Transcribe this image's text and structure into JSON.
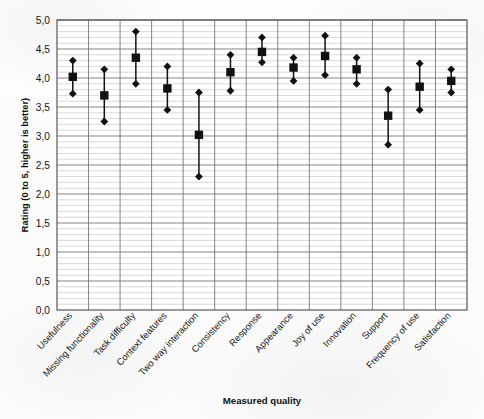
{
  "chart_data": {
    "type": "scatter",
    "title": "",
    "xlabel": "Measured quality",
    "ylabel": "Rating (0 to 5, higher is better)",
    "ylim": [
      0.0,
      5.0
    ],
    "ytick_labels": [
      "0,0",
      "0,5",
      "1,0",
      "1,5",
      "2,0",
      "2,5",
      "3,0",
      "3,5",
      "4,0",
      "4,5",
      "5,0"
    ],
    "ytick_values": [
      0.0,
      0.5,
      1.0,
      1.5,
      2.0,
      2.5,
      3.0,
      3.5,
      4.0,
      4.5,
      5.0
    ],
    "minor_gridlines": true,
    "minor_tick_step": 0.1,
    "grid": true,
    "legend": "none",
    "marker_mean": "filled-square",
    "marker_bounds": "filled-diamond",
    "categories": [
      "Usefulness",
      "Missing functionality",
      "Task difficulty",
      "Context features",
      "Two way interaction",
      "Consistency",
      "Response",
      "Appearance",
      "Joy of use",
      "Innovation",
      "Support",
      "Frequency of use",
      "Satisfaction"
    ],
    "series": [
      {
        "name": "Upper bound",
        "values": [
          4.3,
          4.15,
          4.8,
          4.2,
          3.75,
          4.4,
          4.7,
          4.35,
          4.73,
          4.35,
          3.8,
          4.25,
          4.15
        ]
      },
      {
        "name": "Mean",
        "values": [
          4.02,
          3.7,
          4.35,
          3.82,
          3.02,
          4.1,
          4.45,
          4.18,
          4.38,
          4.15,
          3.35,
          3.85,
          3.95
        ]
      },
      {
        "name": "Lower bound",
        "values": [
          3.73,
          3.25,
          3.9,
          3.45,
          2.3,
          3.78,
          4.27,
          3.95,
          4.05,
          3.9,
          2.85,
          3.45,
          3.75
        ]
      }
    ]
  },
  "axes": {
    "y_title": "Rating (0 to 5, higher is better)",
    "x_title": "Measured quality"
  }
}
